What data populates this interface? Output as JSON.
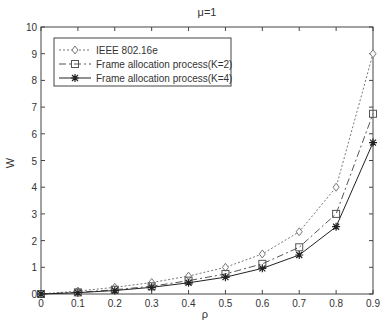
{
  "chart_data": {
    "type": "line",
    "title": "μ=1",
    "xlabel": "ρ",
    "ylabel": "W",
    "xlim": [
      0,
      0.9
    ],
    "ylim": [
      0,
      10
    ],
    "x": [
      0,
      0.1,
      0.2,
      0.3,
      0.4,
      0.5,
      0.6,
      0.7,
      0.8,
      0.9
    ],
    "xticks": [
      "0",
      "0.1",
      "0.2",
      "0.3",
      "0.4",
      "0.5",
      "0.6",
      "0.7",
      "0.8",
      "0.9"
    ],
    "yticks": [
      "0",
      "1",
      "2",
      "3",
      "4",
      "5",
      "6",
      "7",
      "8",
      "9",
      "10"
    ],
    "grid": false,
    "legend_position": "upper left",
    "series": [
      {
        "name": "IEEE 802.16e",
        "style": "dotted",
        "marker": "diamond",
        "values": [
          0,
          0.11,
          0.25,
          0.43,
          0.67,
          1.0,
          1.5,
          2.33,
          4.0,
          9.0
        ]
      },
      {
        "name": "Frame allocation process(K=2)",
        "style": "dashdot",
        "marker": "square",
        "values": [
          0,
          0.06,
          0.16,
          0.29,
          0.5,
          0.75,
          1.13,
          1.75,
          3.0,
          6.75
        ]
      },
      {
        "name": "Frame allocation process(K=4)",
        "style": "solid",
        "marker": "star",
        "values": [
          0,
          0.05,
          0.13,
          0.25,
          0.42,
          0.63,
          0.96,
          1.46,
          2.52,
          5.67
        ]
      }
    ]
  }
}
